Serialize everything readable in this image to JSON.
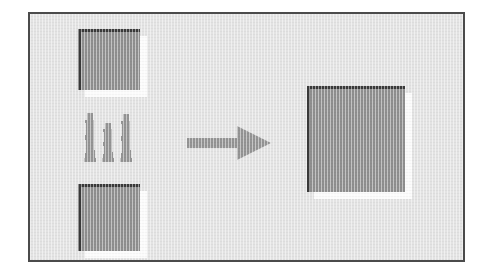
{
  "figure": {
    "background_color": "#e3e3e3",
    "frame_border_color": "#4b4b4b",
    "canvas_color": "#ffffff"
  },
  "shapes": {
    "square_fill_color": "#8f8f8f",
    "square_border_color": "#3a3a3a",
    "square_highlight_color": "#fbfbfb",
    "items": [
      {
        "name": "square-top-left",
        "label": "Top left square",
        "fill": "#8f8f8f"
      },
      {
        "name": "square-bottom-left",
        "label": "Bottom left square",
        "fill": "#8f8f8f"
      },
      {
        "name": "square-result",
        "label": "Resulting merged square",
        "fill": "#8f8f8f"
      }
    ]
  },
  "people": {
    "icon": "people-group-icon",
    "label": "Three standing human figures",
    "count": 3,
    "color": "#949494"
  },
  "arrow": {
    "icon": "arrow-right-icon",
    "label": "Transformation arrow pointing right",
    "direction": "right",
    "color": "#949494"
  }
}
